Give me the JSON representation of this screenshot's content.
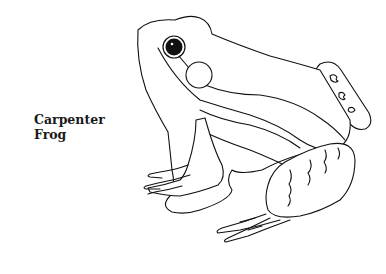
{
  "caption": {
    "line1": "Carpenter",
    "line2": "Frog"
  },
  "illustration": {
    "subject": "frog-line-drawing",
    "style": "black line art on white",
    "colors": {
      "line": "#111111",
      "background": "#ffffff"
    }
  }
}
